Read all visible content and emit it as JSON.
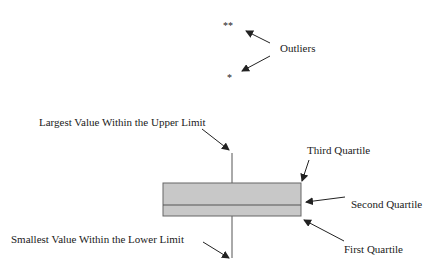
{
  "diagram": {
    "type": "box-plot-anatomy",
    "colors": {
      "box_fill": "#c8c8c8",
      "box_stroke": "#666666",
      "line": "#555555",
      "arrow": "#222222",
      "text": "#1a1a1a"
    },
    "outliers": {
      "label": "Outliers",
      "markers": [
        "**",
        "*"
      ]
    },
    "labels": {
      "upper_whisker": "Largest Value Within the Upper Limit",
      "third_quartile": "Third Quartile",
      "second_quartile": "Second Quartile",
      "first_quartile": "First Quartile",
      "lower_whisker": "Smallest Value Within the Lower Limit"
    }
  }
}
